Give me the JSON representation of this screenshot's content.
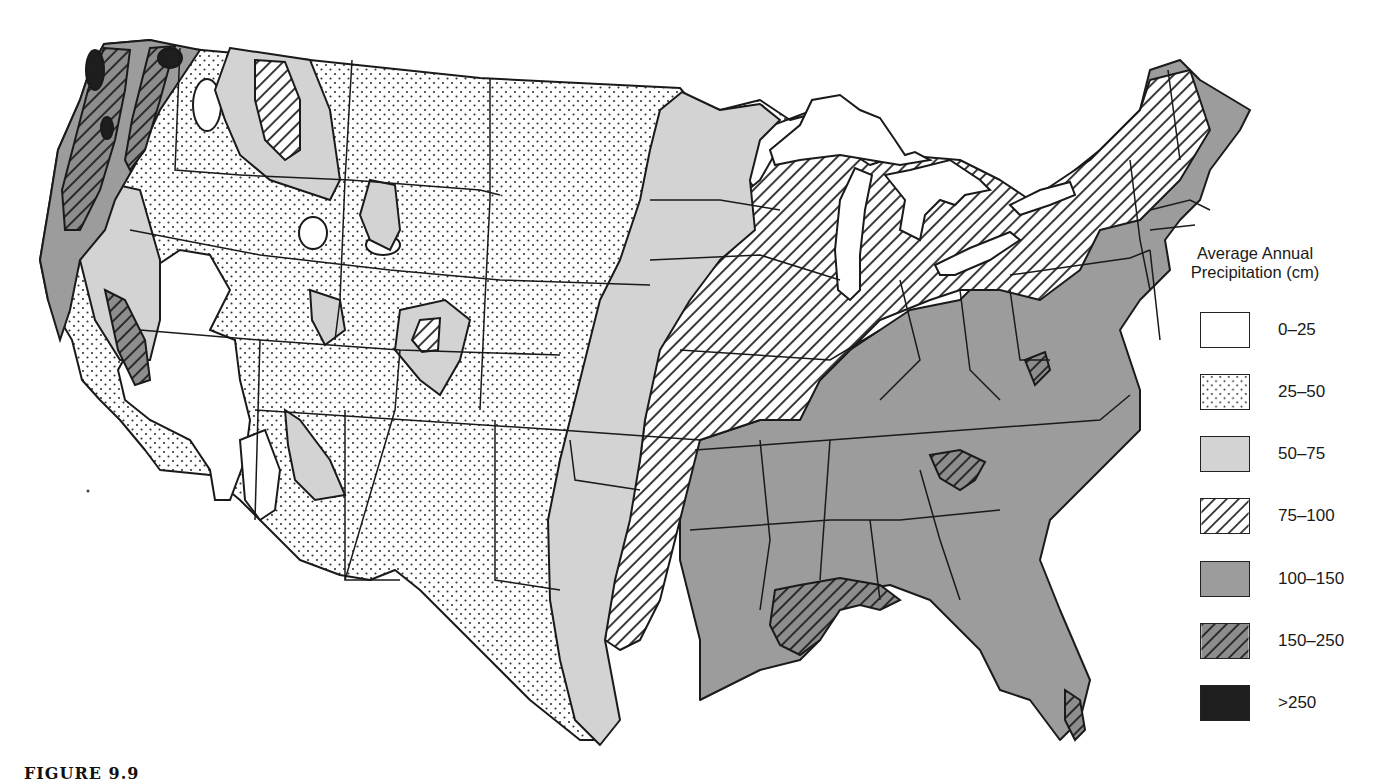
{
  "figure": {
    "caption": "FIGURE 9.9"
  },
  "legend": {
    "title_line1": "Average Annual",
    "title_line2": "Precipitation (cm)",
    "items": [
      {
        "label": "0–25",
        "pattern": "blank",
        "fill": "#ffffff"
      },
      {
        "label": "25–50",
        "pattern": "dots",
        "fill": "#ffffff"
      },
      {
        "label": "50–75",
        "pattern": "light-gray",
        "fill": "#d2d2d2"
      },
      {
        "label": "75–100",
        "pattern": "hatch",
        "fill": "#ffffff"
      },
      {
        "label": "100–150",
        "pattern": "medium-gray",
        "fill": "#9a9a9a"
      },
      {
        "label": "150–250",
        "pattern": "gray-hatch",
        "fill": "#8a8a8a"
      },
      {
        "label": ">250",
        "pattern": "black",
        "fill": "#1e1e1e"
      }
    ]
  },
  "regions": [
    {
      "area": "Pacific Northwest coast",
      "class": "150–250 / >250"
    },
    {
      "area": "Great Basin / Nevada",
      "class": "0–25"
    },
    {
      "area": "Great Plains / Mountain West",
      "class": "25–50"
    },
    {
      "area": "Eastern Plains / Minnesota",
      "class": "50–75"
    },
    {
      "area": "Upper Midwest / Great Lakes / New York",
      "class": "75–100"
    },
    {
      "area": "Southeast / Mid-Atlantic / New England",
      "class": "100–150"
    },
    {
      "area": "Gulf Coast, Southern Appalachians, South Florida",
      "class": "150–250"
    }
  ]
}
